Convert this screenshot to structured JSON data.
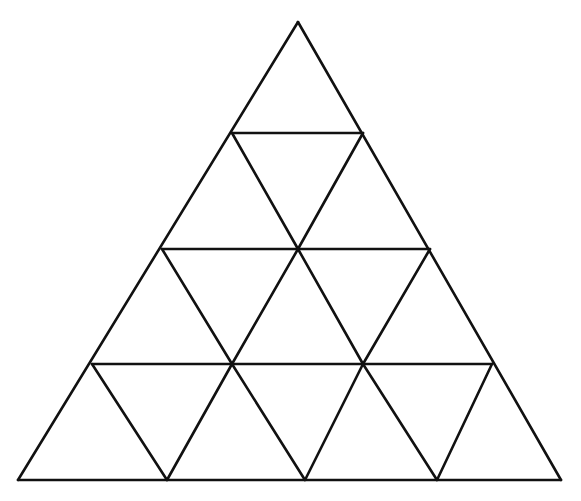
{
  "diagram": {
    "stroke_color": "#111111",
    "background": "#ffffff",
    "apex": [
      298,
      22
    ],
    "rows": [
      {
        "y": 133,
        "x1": 232,
        "x2": 363
      },
      {
        "y": 249,
        "x1": 162,
        "x2": 430
      },
      {
        "y": 364,
        "x1": 92,
        "x2": 492
      },
      {
        "y": 480,
        "x1": 18,
        "x2": 561
      }
    ],
    "inner_lines": [
      [
        232,
        133,
        298,
        249
      ],
      [
        363,
        133,
        298,
        249
      ],
      [
        162,
        249,
        232,
        364
      ],
      [
        298,
        249,
        232,
        364
      ],
      [
        298,
        249,
        363,
        364
      ],
      [
        430,
        249,
        363,
        364
      ],
      [
        92,
        364,
        167,
        480
      ],
      [
        232,
        364,
        167,
        480
      ],
      [
        232,
        364,
        305,
        480
      ],
      [
        363,
        364,
        305,
        480
      ],
      [
        363,
        364,
        437,
        480
      ],
      [
        492,
        364,
        437,
        480
      ]
    ]
  }
}
